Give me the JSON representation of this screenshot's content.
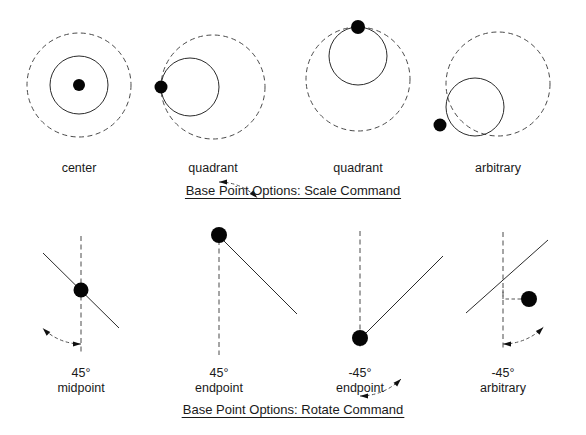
{
  "figure": {
    "title_top": "Base Point Options: Scale Command",
    "title_bottom": "Base Point Options: Rotate Command",
    "background_color": "#ffffff",
    "ink_color": "#1a1a1a",
    "dot_color": "#050505"
  },
  "scale_row": {
    "caption": "Base Point Options: Scale Command",
    "caption_x": 293,
    "caption_y": 195,
    "caption_underline": true,
    "items": [
      {
        "label": "center",
        "label_x": 79,
        "label_y": 172,
        "base_point": "center",
        "dashed_circle": {
          "cx": 79,
          "cy": 85,
          "r": 52
        },
        "solid_circle": {
          "cx": 79,
          "cy": 85,
          "r": 29
        },
        "dot": {
          "cx": 79,
          "cy": 85,
          "r": 6
        }
      },
      {
        "label": "quadrant",
        "label_x": 213,
        "label_y": 172,
        "base_point": "left-quadrant",
        "dashed_circle": {
          "cx": 213,
          "cy": 87,
          "r": 52
        },
        "solid_circle": {
          "cx": 190,
          "cy": 87,
          "r": 29
        },
        "dot": {
          "cx": 161,
          "cy": 87,
          "r": 6.5
        }
      },
      {
        "label": "quadrant",
        "label_x": 358,
        "label_y": 172,
        "base_point": "top-quadrant",
        "dashed_circle": {
          "cx": 358,
          "cy": 79,
          "r": 52
        },
        "solid_circle": {
          "cx": 358,
          "cy": 56,
          "r": 29
        },
        "dot": {
          "cx": 358,
          "cy": 27,
          "r": 7
        }
      },
      {
        "label": "arbitrary",
        "label_x": 498,
        "label_y": 172,
        "base_point": "arbitrary",
        "dashed_circle": {
          "cx": 498,
          "cy": 84,
          "r": 52
        },
        "solid_circle": {
          "cx": 475,
          "cy": 107,
          "r": 29
        },
        "dot": {
          "cx": 440,
          "cy": 125,
          "r": 6.5
        }
      }
    ]
  },
  "rotate_row": {
    "caption": "Base Point Options: Rotate Command",
    "caption_x": 293,
    "caption_y": 414,
    "caption_underline": true,
    "items": [
      {
        "angle_label": "45°",
        "point_label": "midpoint",
        "label_x": 81,
        "angle_label_y": 377,
        "point_label_y": 392,
        "dashed_axis": {
          "x1": 81,
          "y1": 236,
          "x2": 81,
          "y2": 355
        },
        "solid_line": {
          "x1": 43,
          "y1": 253,
          "x2": 119,
          "y2": 328
        },
        "dot": {
          "cx": 81,
          "cy": 290,
          "r": 7.5
        },
        "arc": {
          "cx": 81,
          "cy": 290,
          "r": 54,
          "start_deg": 270,
          "end_deg": 225
        },
        "arrow_start": true,
        "arrow_end": true
      },
      {
        "angle_label": "45°",
        "point_label": "endpoint",
        "label_x": 219,
        "angle_label_y": 377,
        "point_label_y": 392,
        "dashed_axis": {
          "x1": 219,
          "y1": 240,
          "x2": 219,
          "y2": 355
        },
        "solid_line": {
          "x1": 219,
          "y1": 236,
          "x2": 297,
          "y2": 314
        },
        "dot": {
          "cx": 219,
          "cy": 235,
          "r": 8
        },
        "arc": {
          "cx": 219,
          "cy": 236,
          "r": 54,
          "start_deg": 90,
          "end_deg": 45
        },
        "arrow_start": true,
        "arrow_end": true
      },
      {
        "angle_label": "-45°",
        "point_label": "endpoint",
        "label_x": 360,
        "angle_label_y": 377,
        "point_label_y": 392,
        "dashed_axis": {
          "x1": 360,
          "y1": 231,
          "x2": 360,
          "y2": 347
        },
        "solid_line": {
          "x1": 360,
          "y1": 339,
          "x2": 443,
          "y2": 256
        },
        "dot": {
          "cx": 360,
          "cy": 338,
          "r": 8
        },
        "arc": {
          "cx": 360,
          "cy": 338,
          "r": 58,
          "start_deg": 270,
          "end_deg": 315
        },
        "arrow_start": true,
        "arrow_end": true
      },
      {
        "angle_label": "-45°",
        "point_label": "arbitrary",
        "label_x": 503,
        "angle_label_y": 377,
        "point_label_y": 392,
        "dashed_axis": {
          "x1": 503,
          "y1": 232,
          "x2": 503,
          "y2": 348
        },
        "solid_line": {
          "x1": 466,
          "y1": 313,
          "x2": 548,
          "y2": 240
        },
        "dot": {
          "cx": 529,
          "cy": 299,
          "r": 8
        },
        "arc": {
          "cx": 503,
          "cy": 287,
          "r": 57,
          "start_deg": 270,
          "end_deg": 315
        },
        "arrow_start": true,
        "arrow_end": true,
        "leader": {
          "from_x": 521,
          "from_y": 299,
          "corner_x": 503,
          "corner_y": 299,
          "to_x": 503,
          "to_y": 287
        }
      }
    ]
  }
}
